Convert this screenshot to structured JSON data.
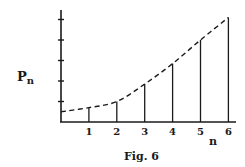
{
  "chart_data": {
    "type": "line",
    "subtype": "stem-with-dashed-envelope",
    "title": "",
    "caption": "Fig. 6",
    "xlabel": "n",
    "ylabel": "P",
    "ylabel_subscript": "n",
    "x": [
      1,
      2,
      3,
      4,
      5,
      6
    ],
    "x_tick_labels": [
      "1",
      "2",
      "3",
      "4",
      "5",
      "6"
    ],
    "series": [
      {
        "name": "P_n (stems)",
        "style": "vertical-stem",
        "values": [
          0.7,
          1.0,
          1.85,
          2.85,
          4.0,
          5.1
        ]
      },
      {
        "name": "P(n) envelope (dashed curve)",
        "style": "dashed",
        "x": [
          0,
          1,
          2,
          3,
          4,
          5,
          6
        ],
        "values": [
          0.5,
          0.7,
          1.0,
          1.85,
          2.85,
          4.0,
          5.1
        ]
      }
    ],
    "y_ticks_count": 5,
    "y_tick_labels": [],
    "xlim": [
      0,
      6.3
    ],
    "ylim": [
      0,
      5.3
    ],
    "grid": false,
    "legend": "none"
  }
}
